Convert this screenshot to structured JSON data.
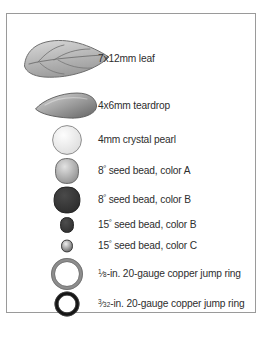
{
  "figure": {
    "name": "beading-materials-legend",
    "background_color": "#ffffff",
    "frame_border_color": "#9a9a9a"
  },
  "items": [
    {
      "id": "leaf",
      "swatch": "leaf-bead",
      "label_prefix": "",
      "label": "7x12mm leaf",
      "size": "7x12mm",
      "type": "leaf",
      "center_x": 60,
      "center_y": 45,
      "shape_w": 86,
      "shape_h": 44,
      "fill_light": "#d9d9d9",
      "fill_dark": "#9c9c9c",
      "stroke": "#6e6e6e"
    },
    {
      "id": "teardrop",
      "swatch": "teardrop-bead",
      "label_prefix": "",
      "label": "4x6mm teardrop",
      "size": "4x6mm",
      "type": "teardrop",
      "center_x": 59,
      "center_y": 92,
      "shape_w": 62,
      "shape_h": 28,
      "fill_light": "#cfcfcf",
      "fill_dark": "#6f6f6f",
      "stroke": "#5a5a5a"
    },
    {
      "id": "crystal-pearl",
      "swatch": "crystal-pearl-bead",
      "label_prefix": "",
      "label": "4mm crystal pearl",
      "size": "4mm",
      "type": "round",
      "center_x": 60,
      "center_y": 126,
      "shape_w": 30,
      "shape_h": 30,
      "fill_light": "#fdfdfd",
      "fill_dark": "#dedede",
      "stroke": "#8f8f8f"
    },
    {
      "id": "seed-8-a",
      "swatch": "seed-bead-8-color-a",
      "label_prefix": "8",
      "label_sup": "º",
      "label": " seed bead, color A",
      "size": "8º",
      "type": "rounded",
      "center_x": 60,
      "center_y": 157,
      "shape_w": 24,
      "shape_h": 26,
      "fill_light": "#e2e2e2",
      "fill_dark": "#8c8c8c",
      "stroke": "#6a6a6a"
    },
    {
      "id": "seed-8-b",
      "swatch": "seed-bead-8-color-b",
      "label_prefix": "8",
      "label_sup": "º",
      "label": " seed bead, color B",
      "size": "8º",
      "type": "rounded",
      "center_x": 60,
      "center_y": 186,
      "shape_w": 27,
      "shape_h": 27,
      "fill_light": "#4a4a4a",
      "fill_dark": "#2b2b2b",
      "stroke": "#242424"
    },
    {
      "id": "seed-15-b",
      "swatch": "seed-bead-15-color-b",
      "label_prefix": "15",
      "label_sup": "º",
      "label": " seed bead, color B",
      "size": "15º",
      "type": "rounded",
      "center_x": 60,
      "center_y": 211,
      "shape_w": 14,
      "shape_h": 16,
      "fill_light": "#4d4d4d",
      "fill_dark": "#2e2e2e",
      "stroke": "#262626"
    },
    {
      "id": "seed-15-c",
      "swatch": "seed-bead-15-color-c",
      "label_prefix": "15",
      "label_sup": "º",
      "label": " seed bead, color C",
      "size": "15º",
      "type": "rounded",
      "center_x": 60,
      "center_y": 232,
      "shape_w": 12,
      "shape_h": 13,
      "fill_light": "#efefef",
      "fill_dark": "#5d5d5d",
      "stroke": "#3a3a3a"
    },
    {
      "id": "jump-ring-8",
      "swatch": "jump-ring-large",
      "label_prefix": "",
      "frac_num": "1",
      "frac_den": "8",
      "label": "-in. 20-gauge copper jump ring",
      "size": "1/8-in.",
      "gauge": "20-gauge",
      "material": "copper",
      "type": "ring",
      "center_x": 60,
      "center_y": 260,
      "shape_w": 32,
      "shape_h": 32,
      "stroke": "#8d8d8d",
      "stroke_w": 4
    },
    {
      "id": "jump-ring-3-32",
      "swatch": "jump-ring-small",
      "label_prefix": "",
      "frac_num": "3",
      "frac_den": "32",
      "label": "-in. 20-gauge copper jump ring",
      "size": "3/32-in.",
      "gauge": "20-gauge",
      "material": "copper",
      "type": "ring",
      "center_x": 60,
      "center_y": 290,
      "shape_w": 25,
      "shape_h": 25,
      "stroke": "#151515",
      "stroke_w": 4
    }
  ]
}
